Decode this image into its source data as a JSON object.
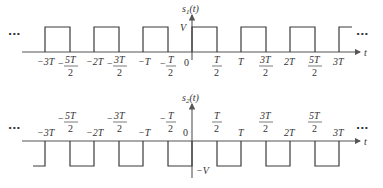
{
  "figure": {
    "top": {
      "name": "s1(t)",
      "ylabel_main": "s",
      "ylabel_sub": "1",
      "ylabel_arg": "(t)",
      "level_label": "V",
      "xlabel": "t",
      "origin_label": "0",
      "ellipsis_left": "···",
      "ellipsis_right": "···",
      "tick_labels": [
        {
          "num": "−3T",
          "den": ""
        },
        {
          "num": "5T",
          "den": "2",
          "neg": true
        },
        {
          "num": "−2T",
          "den": ""
        },
        {
          "num": "3T",
          "den": "2",
          "neg": true
        },
        {
          "num": "−T",
          "den": ""
        },
        {
          "num": "T",
          "den": "2",
          "neg": true
        },
        {
          "num": "T",
          "den": "2"
        },
        {
          "num": "T",
          "den": ""
        },
        {
          "num": "3T",
          "den": "2"
        },
        {
          "num": "2T",
          "den": ""
        },
        {
          "num": "5T",
          "den": "2"
        },
        {
          "num": "3T",
          "den": ""
        }
      ]
    },
    "bottom": {
      "name": "s2(t)",
      "ylabel_main": "s",
      "ylabel_sub": "2",
      "ylabel_arg": "(t)",
      "level_label": "−V",
      "xlabel": "t",
      "origin_label": "0",
      "ellipsis_left": "···",
      "ellipsis_right": "···"
    }
  },
  "labels": {
    "t1_m3T": "−3T",
    "t1_m5T": "5T",
    "t1_m2T": "−2T",
    "t1_m3T2": "3T",
    "t1_mT": "−T",
    "t1_mT2": "T",
    "t1_T2": "T",
    "t1_T": "T",
    "t1_3T2": "3T",
    "t1_2T": "2T",
    "t1_5T2": "5T",
    "t1_3T": "3T",
    "two": "2",
    "minus": "−"
  }
}
